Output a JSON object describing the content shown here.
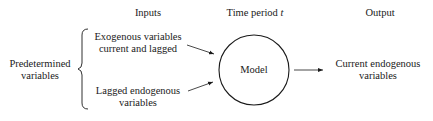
{
  "headers": {
    "inputs": "Inputs",
    "time_period": "Time period",
    "time_var": "t",
    "output": "Output"
  },
  "left": {
    "line1": "Predetermined",
    "line2": "variables"
  },
  "inputs": {
    "exogenous": {
      "line1": "Exogenous variables",
      "line2": "current and lagged"
    },
    "lagged": {
      "line1": "Lagged endogenous",
      "line2": "variables"
    }
  },
  "model": {
    "label": "Model"
  },
  "output": {
    "line1": "Current endogenous",
    "line2": "variables"
  }
}
